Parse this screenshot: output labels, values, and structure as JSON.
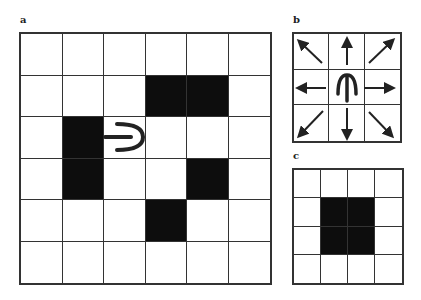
{
  "panels": {
    "a": {
      "label": "a",
      "rows": 6,
      "cols": 6,
      "filled": [
        [
          1,
          3
        ],
        [
          1,
          4
        ],
        [
          2,
          1
        ],
        [
          3,
          1
        ],
        [
          3,
          4
        ],
        [
          4,
          3
        ]
      ],
      "agent_glyph": {
        "row": 2,
        "col": 2,
        "orientation": "facing-right",
        "icon": "fork-agent-icon"
      }
    },
    "b": {
      "label": "b",
      "rows": 3,
      "cols": 3,
      "center_glyph": {
        "orientation": "facing-up",
        "icon": "fork-agent-icon"
      },
      "arrows": [
        "up-left",
        "up",
        "up-right",
        "left",
        "right",
        "down-left",
        "down",
        "down-right"
      ]
    },
    "c": {
      "label": "c",
      "rows": 4,
      "cols": 4,
      "filled": [
        [
          1,
          1
        ],
        [
          1,
          2
        ],
        [
          2,
          1
        ],
        [
          2,
          2
        ]
      ]
    }
  },
  "colors": {
    "line": "#333333",
    "fill": "#0d0d0d",
    "background": "#ffffff"
  }
}
